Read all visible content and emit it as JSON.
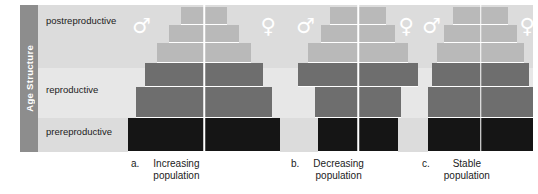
{
  "figure": {
    "axis_label": "Age Structure",
    "age_bands": [
      {
        "id": "postreproductive",
        "label": "postreproductive"
      },
      {
        "id": "reproductive",
        "label": "reproductive"
      },
      {
        "id": "prereproductive",
        "label": "prereproductive"
      }
    ],
    "sex_symbols": {
      "male": "♂",
      "female": "♀"
    },
    "colors": {
      "panel_background": "#e3e3e3",
      "band_postreproductive": "#dcdcdc",
      "band_reproductive": "#e7e7e7",
      "band_prereproductive": "#dcdcdc",
      "tab_background": "#8d8d8d",
      "bar_postreproductive": "#b9b9b9",
      "bar_reproductive": "#6e6e6e",
      "bar_prereproductive": "#151515",
      "separator": "#ffffff",
      "text": "#1b1b1b"
    }
  },
  "chart_data": {
    "type": "bar",
    "title": "Age Structure",
    "xlabel": "",
    "ylabel": "Age Structure",
    "grid": false,
    "legend_position": "in-plot",
    "orientation": "horizontal-diverging",
    "note": "Three population age-structure pyramids; each tier bar is split down the centre into male (left) and female (right) halves. Bar width is relative population size of that age cohort (0-1 of panel width).",
    "categories": [
      "postreproductive-5",
      "postreproductive-4",
      "postreproductive-3",
      "reproductive-2",
      "reproductive-1",
      "prereproductive-1"
    ],
    "series": [
      {
        "name": "Increasing population",
        "letter": "a.",
        "caption_line1": "Increasing",
        "caption_line2": "population",
        "age_group_of_tier": [
          "postreproductive",
          "postreproductive",
          "postreproductive",
          "reproductive",
          "reproductive",
          "prereproductive"
        ],
        "values": [
          0.3,
          0.46,
          0.62,
          0.78,
          0.9,
          1.0
        ]
      },
      {
        "name": "Decreasing population",
        "letter": "b.",
        "caption_line1": "Decreasing",
        "caption_line2": "population",
        "age_group_of_tier": [
          "postreproductive",
          "postreproductive",
          "postreproductive",
          "reproductive",
          "reproductive",
          "prereproductive"
        ],
        "values": [
          0.46,
          0.62,
          0.84,
          1.0,
          0.72,
          0.66
        ]
      },
      {
        "name": "Stable population",
        "letter": "c.",
        "caption_line1": "Stable",
        "caption_line2": "population",
        "age_group_of_tier": [
          "postreproductive",
          "postreproductive",
          "postreproductive",
          "reproductive",
          "reproductive",
          "prereproductive"
        ],
        "values": [
          0.52,
          0.7,
          0.82,
          0.92,
          1.0,
          1.0
        ]
      }
    ]
  }
}
